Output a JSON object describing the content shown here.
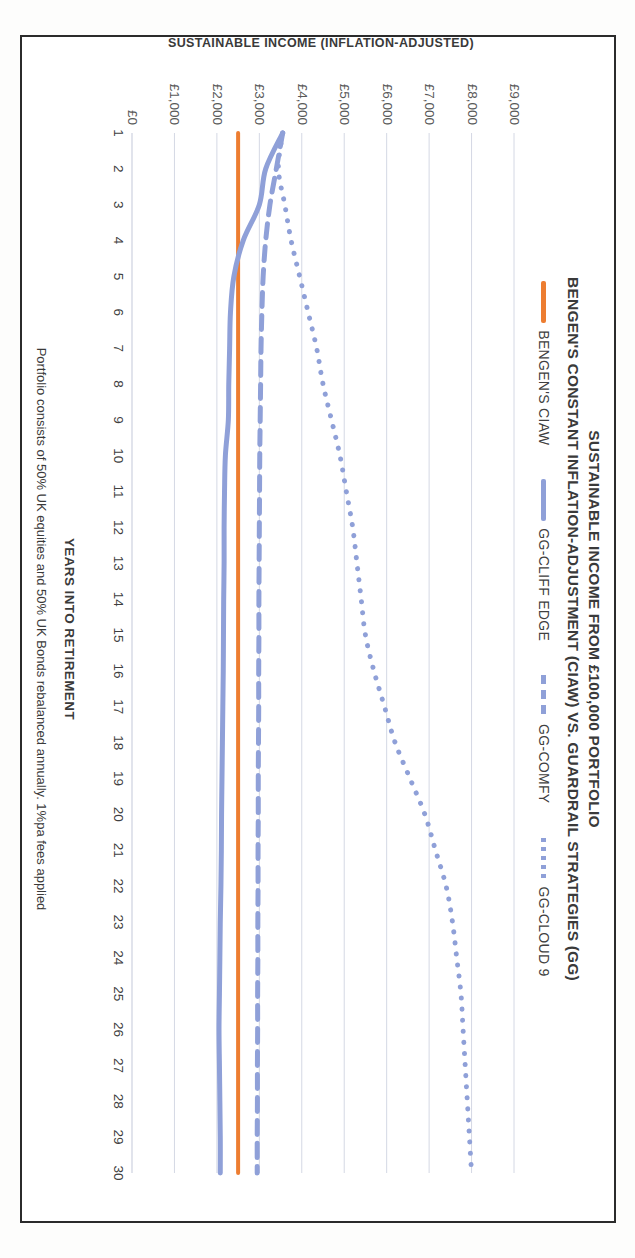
{
  "chart_data": {
    "type": "line",
    "title": "SUSTAINABLE INCOME FROM £100,000 PORTFOLIO",
    "subtitle": "BENGEN'S CONSTANT INFLATION-ADJUSTMENT (CIAW) VS. GUARDRAIL STRATEGIES (GG)",
    "xlabel": "YEARS INTO RETIREMENT",
    "ylabel": "SUSTAINABLE INCOME (INFLATION-ADJUSTED)",
    "footnote": "Portfolio consists of 50% UK equities and 50% UK Bonds rebalanced annually.  1%pa fees applied",
    "grid": true,
    "legend_position": "top",
    "xlim": [
      1,
      30
    ],
    "ylim": [
      0,
      9000
    ],
    "x": [
      1,
      2,
      3,
      4,
      5,
      6,
      7,
      8,
      9,
      10,
      11,
      12,
      13,
      14,
      15,
      16,
      17,
      18,
      19,
      20,
      21,
      22,
      23,
      24,
      25,
      26,
      27,
      28,
      29,
      30
    ],
    "xticklabels": [
      "1",
      "2",
      "3",
      "4",
      "5",
      "6",
      "7",
      "8",
      "9",
      "10",
      "11",
      "12",
      "13",
      "14",
      "15",
      "16",
      "17",
      "18",
      "19",
      "20",
      "21",
      "22",
      "23",
      "24",
      "25",
      "26",
      "27",
      "28",
      "29",
      "30"
    ],
    "yticks": [
      0,
      1000,
      2000,
      3000,
      4000,
      5000,
      6000,
      7000,
      8000,
      9000
    ],
    "yticklabels": [
      "£0",
      "£1,000",
      "£2,000",
      "£3,000",
      "£4,000",
      "£5,000",
      "£6,000",
      "£7,000",
      "£8,000",
      "£9,000"
    ],
    "series": [
      {
        "name": "BENGEN'S CIAW",
        "color": "#ED7D31",
        "style": "solid",
        "width": 4,
        "values": [
          2500,
          2500,
          2500,
          2500,
          2500,
          2500,
          2500,
          2500,
          2500,
          2500,
          2500,
          2500,
          2500,
          2500,
          2500,
          2500,
          2500,
          2500,
          2500,
          2500,
          2500,
          2500,
          2500,
          2500,
          2500,
          2500,
          2500,
          2500,
          2500,
          2500
        ]
      },
      {
        "name": "GG-CLIFF EDGE",
        "color": "#8FA0D8",
        "style": "solid",
        "width": 5,
        "values": [
          3550,
          3150,
          3000,
          2620,
          2400,
          2320,
          2300,
          2280,
          2270,
          2200,
          2180,
          2170,
          2170,
          2160,
          2155,
          2150,
          2140,
          2130,
          2120,
          2110,
          2105,
          2095,
          2080,
          2070,
          2060,
          2050,
          2060,
          2070,
          2080,
          2080
        ]
      },
      {
        "name": "GG-COMFY",
        "color": "#8FA0D8",
        "style": "dashed",
        "width": 5,
        "values": [
          3550,
          3400,
          3250,
          3150,
          3090,
          3060,
          3040,
          3030,
          3020,
          3010,
          3005,
          3000,
          2995,
          2990,
          2990,
          2985,
          2985,
          2980,
          2975,
          2975,
          2970,
          2970,
          2965,
          2965,
          2960,
          2960,
          2955,
          2955,
          2950,
          2950
        ]
      },
      {
        "name": "GG-CLOUD 9",
        "color": "#8FA0D8",
        "style": "dotted",
        "width": 5,
        "values": [
          3550,
          3450,
          3600,
          3750,
          3950,
          4150,
          4350,
          4500,
          4700,
          4900,
          5050,
          5200,
          5300,
          5400,
          5500,
          5700,
          5950,
          6200,
          6550,
          6900,
          7150,
          7400,
          7550,
          7650,
          7750,
          7800,
          7850,
          7900,
          7950,
          8000
        ]
      }
    ]
  }
}
